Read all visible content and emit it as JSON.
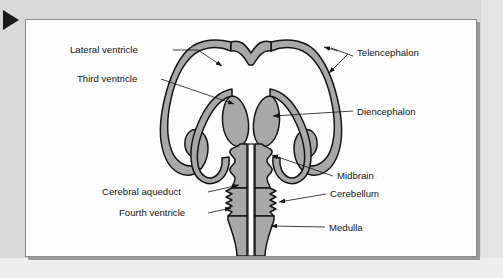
{
  "figure": {
    "marker_icon": "play-triangle-marker",
    "panel_background": "#fdfdfd",
    "page_background": "#d9d9d9",
    "tissue_fill_color": "#a8a8a8",
    "outline_color": "#141414",
    "cavity_fill_color": "#ffffff"
  },
  "diagram": {
    "labels": [
      {
        "id": "lateral-ventricle",
        "text": "Lateral ventricle",
        "side": "left",
        "x": 61,
        "y": 33
      },
      {
        "id": "third-ventricle",
        "text": "Third ventricle",
        "side": "left",
        "x": 68,
        "y": 62
      },
      {
        "id": "cerebral-aqueduct",
        "text": "Cerebral aqueduct",
        "side": "left",
        "x": 93,
        "y": 170
      },
      {
        "id": "fourth-ventricle",
        "text": "Fourth ventricle",
        "side": "left",
        "x": 110,
        "y": 191
      },
      {
        "id": "telencephalon",
        "text": "Telencephalon",
        "side": "right",
        "x": 330,
        "y": 32
      },
      {
        "id": "diencephalon",
        "text": "Diencephalon",
        "side": "right",
        "x": 330,
        "y": 88
      },
      {
        "id": "midbrain",
        "text": "Midbrain",
        "side": "right",
        "x": 310,
        "y": 161
      },
      {
        "id": "cerebellum",
        "text": "Cerebellum",
        "side": "right",
        "x": 303,
        "y": 177
      },
      {
        "id": "medulla",
        "text": "Medulla",
        "side": "right",
        "x": 302,
        "y": 205
      }
    ],
    "structures": [
      {
        "id": "telencephalon-wall",
        "name": "Telencephalon wall"
      },
      {
        "id": "lateral-ventricle-cavity",
        "name": "Lateral ventricle cavity"
      },
      {
        "id": "diencephalon-body",
        "name": "Diencephalon"
      },
      {
        "id": "third-ventricle-cavity",
        "name": "Third ventricle cavity"
      },
      {
        "id": "midbrain-body",
        "name": "Midbrain"
      },
      {
        "id": "cerebral-aqueduct-cavity",
        "name": "Cerebral aqueduct"
      },
      {
        "id": "cerebellum-body",
        "name": "Cerebellum"
      },
      {
        "id": "fourth-ventricle-cavity",
        "name": "Fourth ventricle cavity"
      },
      {
        "id": "medulla-body",
        "name": "Medulla"
      },
      {
        "id": "central-canal",
        "name": "Central canal"
      }
    ]
  }
}
